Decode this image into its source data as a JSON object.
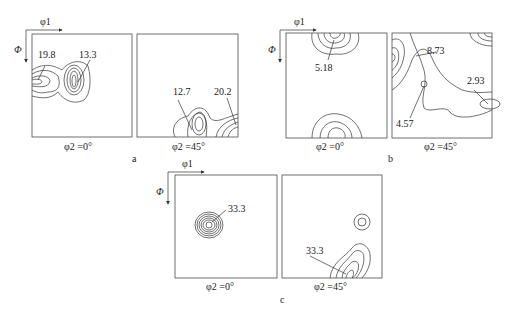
{
  "figure": {
    "panels": [
      {
        "id": "a",
        "label": "a",
        "axis_x": "φ1",
        "axis_y": "Φ",
        "sections": [
          {
            "caption": "φ2 =0°",
            "annotations": [
              "19.8",
              "13.3"
            ]
          },
          {
            "caption": "φ2 =45°",
            "annotations": [
              "12.7",
              "20.2"
            ]
          }
        ]
      },
      {
        "id": "b",
        "label": "b",
        "axis_x": "φ1",
        "axis_y": "Φ",
        "sections": [
          {
            "caption": "φ2 =0°",
            "annotations": [
              "5.18"
            ]
          },
          {
            "caption": "φ2 =45°",
            "annotations": [
              "8.73",
              "2.93",
              "4.57"
            ]
          }
        ]
      },
      {
        "id": "c",
        "label": "c",
        "axis_x": "φ1",
        "axis_y": "Φ",
        "sections": [
          {
            "caption": "φ2 =0°",
            "annotations": [
              "33.3"
            ]
          },
          {
            "caption": "φ2 =45°",
            "annotations": [
              "33.3"
            ]
          }
        ]
      }
    ]
  }
}
